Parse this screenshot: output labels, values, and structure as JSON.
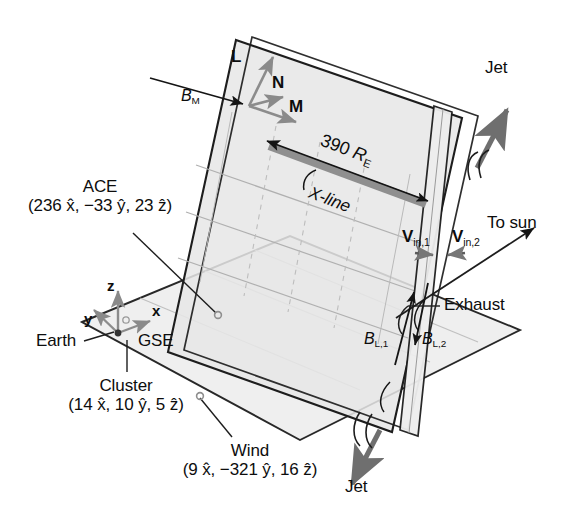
{
  "figure": {
    "type": "schematic-diagram",
    "width": 574,
    "height": 513,
    "background_color": "#ffffff",
    "line_color": "#1a1a1a",
    "plane_fill_light": "#ececec",
    "plane_fill_mid": "#e2e2e2",
    "xline_band_color": "#8a8a8a",
    "grid_color": "#b5b5b5",
    "arrow_gray": "#8c8c8c"
  },
  "labels": {
    "L": "L",
    "N": "N",
    "M": "M",
    "B_M": {
      "base": "B",
      "sub": "M"
    },
    "xline_length": {
      "value": "390",
      "unit": "R",
      "unit_sub": "E"
    },
    "xline_name": "X-line",
    "jet_top": "Jet",
    "jet_bottom": "Jet",
    "to_sun": "To sun",
    "exhaust": "Exhaust",
    "earth": "Earth",
    "gse": "GSE",
    "axis_x": "x",
    "axis_y": "y",
    "axis_z": "z",
    "v_in_1": {
      "base": "V",
      "sub": "in,1"
    },
    "v_in_2": {
      "base": "V",
      "sub": "in,2"
    },
    "B_L1": {
      "base": "B",
      "sub": "L,1"
    },
    "B_L2": {
      "base": "B",
      "sub": "L,2"
    }
  },
  "spacecraft": [
    {
      "id": "ace",
      "name": "ACE",
      "position_text": "(236 x̂, −33 ŷ, 23 ẑ)",
      "x": "236",
      "y": "−33",
      "z": "23",
      "units": "R_E (GSE)"
    },
    {
      "id": "cluster",
      "name": "Cluster",
      "position_text": "(14 x̂, 10 ŷ, 5 ẑ)",
      "x": "14",
      "y": "10",
      "z": "5",
      "units": "R_E (GSE)"
    },
    {
      "id": "wind",
      "name": "Wind",
      "position_text": "(9 x̂, −321 ŷ, 16 ẑ)",
      "x": "9",
      "y": "−321",
      "z": "16",
      "units": "R_E (GSE)"
    }
  ],
  "parts": {
    "paren_open": "(",
    "paren_close": ")",
    "comma": ",",
    "x_hat": "x̂",
    "y_hat": "ŷ",
    "z_hat": "ẑ"
  }
}
